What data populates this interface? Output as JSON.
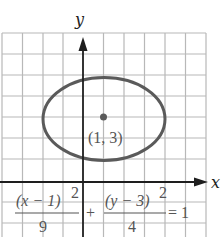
{
  "figure": {
    "axes": {
      "x_label": "x",
      "y_label": "y"
    },
    "grid": {
      "spacing_units": 1,
      "x_range": [
        -4,
        6
      ],
      "y_range": [
        -2,
        7
      ]
    },
    "ellipse": {
      "center": [
        1,
        3
      ],
      "semi_major_x": 3,
      "semi_minor_y": 2,
      "stroke_color": "#5a5a5a"
    },
    "center_point_label": "(1, 3)",
    "equation": {
      "term1_numerator": "(x − 1)",
      "term1_exponent": "2",
      "term1_denominator": "9",
      "plus": "+",
      "term2_numerator": "(y − 3)",
      "term2_exponent": "2",
      "term2_denominator": "4",
      "equals": "= 1"
    }
  }
}
